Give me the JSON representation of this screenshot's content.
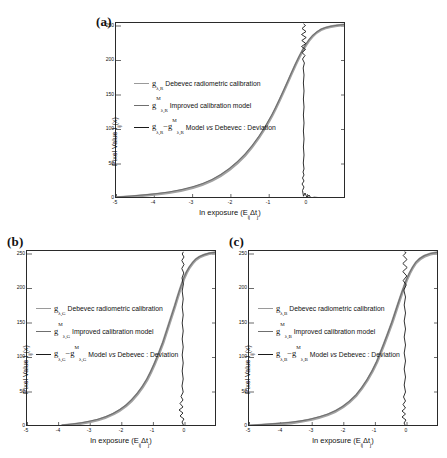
{
  "figure": {
    "panels": [
      {
        "label": "(a)",
        "channel": "R",
        "axes": {
          "xlabel_prefix": "ln exposure (E",
          "xlabel_sub1": "ij",
          "xlabel_mid": "Δt",
          "xlabel_sub2": "j",
          "xlabel_suffix": ")",
          "ylabel_prefix": "Pixel Value I",
          "ylabel_sub": "ij",
          "ylabel_suffix": "(x)",
          "xticks": [
            "-5",
            "-4",
            "-3",
            "-2",
            "-1",
            "0"
          ],
          "yticks": [
            "0",
            "50",
            "100",
            "150",
            "200",
            "250"
          ],
          "xlim": [
            -5.3,
            0.7
          ],
          "ylim": [
            0,
            255
          ]
        },
        "legend": [
          {
            "symbol": "g",
            "sub": "λ,R",
            "sup": "",
            "sub2": "",
            "sup2": "",
            "minus": false,
            "text": "Debevec radiometric calibration",
            "italic_word": "",
            "color": "#9a9a9a"
          },
          {
            "symbol": "g",
            "sub": "λ,R",
            "sup": "M",
            "sub2": "",
            "sup2": "",
            "minus": false,
            "text": "Improved calibration model",
            "italic_word": "",
            "color": "#6f6f6f"
          },
          {
            "symbol": "g",
            "sub": "λ,R",
            "sup": "",
            "sub2": "λ,R",
            "sup2": "M",
            "minus": true,
            "text": "Model vs Debevec : Deviation",
            "italic_word": "vs",
            "color": "#1a1a1a"
          }
        ]
      },
      {
        "label": "(b)",
        "channel": "G",
        "axes": {
          "xlabel_prefix": "ln exposure (E",
          "xlabel_sub1": "ij",
          "xlabel_mid": "Δt",
          "xlabel_sub2": "j",
          "xlabel_suffix": ")",
          "ylabel_prefix": "Pixel Value I",
          "ylabel_sub": "ij",
          "ylabel_suffix": "(x)",
          "xticks": [
            "-5",
            "-4",
            "-3",
            "-2",
            "-1",
            "0"
          ],
          "yticks": [
            "0",
            "50",
            "100",
            "150",
            "200",
            "250"
          ],
          "xlim": [
            -5.3,
            0.7
          ],
          "ylim": [
            0,
            255
          ]
        },
        "legend": [
          {
            "symbol": "g",
            "sub": "λ,G",
            "sup": "",
            "sub2": "",
            "sup2": "",
            "minus": false,
            "text": "Debevec radiometric calibration",
            "italic_word": "",
            "color": "#9a9a9a"
          },
          {
            "symbol": "g",
            "sub": "λ,G",
            "sup": "M",
            "sub2": "",
            "sup2": "",
            "minus": false,
            "text": "Improved calibration model",
            "italic_word": "",
            "color": "#6f6f6f"
          },
          {
            "symbol": "g",
            "sub": "λ,G",
            "sup": "",
            "sub2": "λ,G",
            "sup2": "M",
            "minus": true,
            "text": "Model vs Debevec : Deviation",
            "italic_word": "vs",
            "color": "#1a1a1a"
          }
        ]
      },
      {
        "label": "(c)",
        "channel": "B",
        "axes": {
          "xlabel_prefix": "ln exposure (E",
          "xlabel_sub1": "ij",
          "xlabel_mid": "Δt",
          "xlabel_sub2": "j",
          "xlabel_suffix": ")",
          "ylabel_prefix": "Pixel Value I",
          "ylabel_sub": "ij",
          "ylabel_suffix": "(x)",
          "xticks": [
            "-5",
            "-4",
            "-3",
            "-2",
            "-1",
            "0"
          ],
          "yticks": [
            "0",
            "50",
            "100",
            "150",
            "200",
            "250"
          ],
          "xlim": [
            -5.3,
            0.7
          ],
          "ylim": [
            0,
            255
          ]
        },
        "legend": [
          {
            "symbol": "g",
            "sub": "λ,B",
            "sup": "",
            "sub2": "",
            "sup2": "",
            "minus": false,
            "text": "Debevec radiometric calibration",
            "italic_word": "",
            "color": "#9a9a9a"
          },
          {
            "symbol": "g",
            "sub": "λ,B",
            "sup": "M",
            "sub2": "",
            "sup2": "",
            "minus": false,
            "text": "Improved calibration model",
            "italic_word": "",
            "color": "#6f6f6f"
          },
          {
            "symbol": "g",
            "sub": "λ,B",
            "sup": "",
            "sub2": "λ,B",
            "sup2": "M",
            "minus": true,
            "text": "Model vs Debevec : Deviation",
            "italic_word": "vs",
            "color": "#1a1a1a"
          }
        ]
      }
    ]
  },
  "chart_data": [
    {
      "type": "line",
      "panel": "(a)",
      "title": "",
      "xlabel": "ln exposure (E_ij Δt_j)",
      "ylabel": "Pixel Value I_ij(x)",
      "xlim": [
        -5.3,
        0.7
      ],
      "ylim": [
        0,
        255
      ],
      "xticks": [
        -5,
        -4,
        -3,
        -2,
        -1,
        0
      ],
      "yticks": [
        0,
        50,
        100,
        150,
        200,
        250
      ],
      "grid": false,
      "legend_position": "center-left",
      "series": [
        {
          "name": "g_λ,R Debevec radiometric calibration",
          "color": "#9a9a9a",
          "x": [
            -5.3,
            -5.0,
            -4.5,
            -4.0,
            -3.5,
            -3.0,
            -2.6,
            -2.2,
            -1.8,
            -1.5,
            -1.2,
            -1.0,
            -0.8,
            -0.6,
            -0.45,
            -0.35,
            -0.25,
            -0.18,
            -0.12,
            -0.06,
            0.0,
            0.1,
            0.25,
            0.45,
            0.7
          ],
          "y": [
            2,
            3,
            5,
            7,
            10,
            15,
            21,
            30,
            44,
            58,
            78,
            95,
            116,
            142,
            163,
            178,
            194,
            206,
            216,
            227,
            236,
            243,
            249,
            252,
            254
          ]
        },
        {
          "name": "g_λ,R^M Improved calibration model",
          "color": "#6f6f6f",
          "x": [
            -5.3,
            -5.0,
            -4.5,
            -4.0,
            -3.5,
            -3.0,
            -2.6,
            -2.2,
            -1.8,
            -1.5,
            -1.2,
            -1.0,
            -0.8,
            -0.6,
            -0.45,
            -0.35,
            -0.25,
            -0.18,
            -0.12,
            -0.06,
            0.0,
            0.1,
            0.25,
            0.45,
            0.7
          ],
          "y": [
            2,
            3,
            5,
            8,
            11,
            16,
            22,
            31,
            45,
            60,
            80,
            97,
            118,
            144,
            165,
            180,
            196,
            207,
            217,
            228,
            237,
            244,
            250,
            253,
            255
          ]
        },
        {
          "name": "g_λ,R - g_λ,R^M Model vs Debevec : Deviation",
          "color": "#1a1a1a",
          "description": "near-vertical jagged deviation trace centered at x ≈ -0.05, amplitude grows toward top (pixel value 250) and a wide lobe near pixel value 0",
          "x": [
            -0.05,
            -0.04,
            -0.06,
            -0.05,
            -0.07,
            -0.04,
            -0.05,
            -0.06,
            -0.05,
            -0.05,
            -0.06,
            -0.05,
            -0.04,
            -0.06,
            -0.09,
            -0.05,
            -0.12,
            -0.07,
            -0.18,
            -0.1,
            -0.22,
            -0.14,
            -0.25,
            -0.16,
            -0.28
          ],
          "y": [
            0,
            6,
            12,
            20,
            28,
            40,
            55,
            70,
            88,
            105,
            125,
            145,
            162,
            178,
            192,
            203,
            212,
            220,
            228,
            234,
            240,
            244,
            248,
            251,
            254
          ]
        }
      ]
    },
    {
      "type": "line",
      "panel": "(b)",
      "title": "",
      "xlabel": "ln exposure (E_ij Δt_j)",
      "ylabel": "Pixel Value I_ij(x)",
      "xlim": [
        -5.3,
        0.7
      ],
      "ylim": [
        0,
        255
      ],
      "xticks": [
        -5,
        -4,
        -3,
        -2,
        -1,
        0
      ],
      "yticks": [
        0,
        50,
        100,
        150,
        200,
        250
      ],
      "grid": false,
      "legend_position": "center-left",
      "series": [
        {
          "name": "g_λ,G Debevec radiometric calibration",
          "color": "#9a9a9a",
          "x": [
            -4.1,
            -3.8,
            -3.4,
            -3.0,
            -2.6,
            -2.2,
            -1.9,
            -1.6,
            -1.35,
            -1.1,
            -0.9,
            -0.7,
            -0.55,
            -0.42,
            -0.32,
            -0.24,
            -0.18,
            -0.13,
            -0.08,
            -0.04,
            0.0,
            0.08,
            0.2,
            0.4,
            0.7
          ],
          "y": [
            2,
            4,
            6,
            10,
            16,
            24,
            33,
            45,
            58,
            75,
            92,
            113,
            133,
            153,
            171,
            186,
            198,
            209,
            219,
            228,
            235,
            242,
            248,
            252,
            254
          ]
        },
        {
          "name": "g_λ,G^M Improved calibration model",
          "color": "#6f6f6f",
          "x": [
            -4.1,
            -3.8,
            -3.4,
            -3.0,
            -2.6,
            -2.2,
            -1.9,
            -1.6,
            -1.35,
            -1.1,
            -0.9,
            -0.7,
            -0.55,
            -0.42,
            -0.32,
            -0.24,
            -0.18,
            -0.13,
            -0.08,
            -0.04,
            0.0,
            0.08,
            0.2,
            0.4,
            0.7
          ],
          "y": [
            2,
            4,
            7,
            11,
            17,
            25,
            34,
            46,
            60,
            77,
            94,
            115,
            135,
            155,
            173,
            188,
            200,
            210,
            220,
            229,
            236,
            243,
            249,
            253,
            255
          ]
        },
        {
          "name": "g_λ,G - g_λ,G^M Model vs Debevec : Deviation",
          "color": "#1a1a1a",
          "description": "near-vertical deviation trace at x ≈ -0.05 with small jitter; wider lobe near pixel value 0-20",
          "x": [
            -0.25,
            -0.08,
            -0.05,
            -0.12,
            -0.06,
            -0.05,
            -0.07,
            -0.05,
            -0.05,
            -0.06,
            -0.05,
            -0.05,
            -0.06,
            -0.05,
            -0.05,
            -0.06,
            -0.05,
            -0.06,
            -0.05,
            -0.07,
            -0.05,
            -0.06,
            -0.05,
            -0.06,
            -0.05
          ],
          "y": [
            0,
            5,
            10,
            16,
            24,
            34,
            48,
            62,
            80,
            98,
            118,
            138,
            156,
            172,
            186,
            198,
            208,
            217,
            225,
            232,
            238,
            243,
            247,
            251,
            254
          ]
        }
      ]
    },
    {
      "type": "line",
      "panel": "(c)",
      "title": "",
      "xlabel": "ln exposure (E_ij Δt_j)",
      "ylabel": "Pixel Value I_ij(x)",
      "xlim": [
        -5.3,
        0.7
      ],
      "ylim": [
        0,
        255
      ],
      "xticks": [
        -5,
        -4,
        -3,
        -2,
        -1,
        0
      ],
      "yticks": [
        0,
        50,
        100,
        150,
        200,
        250
      ],
      "grid": false,
      "legend_position": "center-left",
      "series": [
        {
          "name": "g_λ,B Debevec radiometric calibration",
          "color": "#9a9a9a",
          "x": [
            -5.2,
            -4.8,
            -4.4,
            -4.0,
            -3.5,
            -3.0,
            -2.6,
            -2.2,
            -1.9,
            -1.6,
            -1.3,
            -1.05,
            -0.85,
            -0.65,
            -0.5,
            -0.38,
            -0.28,
            -0.2,
            -0.14,
            -0.07,
            0.0,
            0.1,
            0.25,
            0.45,
            0.7
          ],
          "y": [
            2,
            3,
            5,
            7,
            11,
            17,
            24,
            34,
            44,
            58,
            76,
            94,
            112,
            136,
            156,
            174,
            190,
            202,
            212,
            224,
            234,
            242,
            248,
            252,
            254
          ]
        },
        {
          "name": "g_λ,B^M Improved calibration model",
          "color": "#6f6f6f",
          "x": [
            -5.2,
            -4.8,
            -4.4,
            -4.0,
            -3.5,
            -3.0,
            -2.6,
            -2.2,
            -1.9,
            -1.6,
            -1.3,
            -1.05,
            -0.85,
            -0.65,
            -0.5,
            -0.38,
            -0.28,
            -0.2,
            -0.14,
            -0.07,
            0.0,
            0.1,
            0.25,
            0.45,
            0.7
          ],
          "y": [
            2,
            3,
            6,
            8,
            12,
            18,
            25,
            35,
            46,
            60,
            78,
            96,
            114,
            138,
            158,
            176,
            192,
            204,
            214,
            225,
            235,
            243,
            249,
            253,
            255
          ]
        },
        {
          "name": "g_λ,B - g_λ,B^M Model vs Debevec : Deviation",
          "color": "#1a1a1a",
          "description": "near-vertical jagged deviation trace at x ≈ -0.05; jitter amplitude largest above pixel value 200 and a wide horizontal lobe near pixel value 0",
          "x": [
            -0.05,
            -0.06,
            -0.05,
            -0.07,
            -0.04,
            -0.06,
            -0.05,
            -0.05,
            -0.06,
            -0.05,
            -0.05,
            -0.06,
            -0.05,
            -0.05,
            -0.07,
            -0.05,
            -0.1,
            -0.06,
            -0.15,
            -0.08,
            -0.2,
            -0.12,
            -0.24,
            -0.15,
            -0.26
          ],
          "y": [
            0,
            6,
            13,
            22,
            32,
            45,
            60,
            76,
            94,
            112,
            132,
            150,
            167,
            182,
            195,
            206,
            215,
            223,
            230,
            236,
            241,
            246,
            249,
            252,
            254
          ]
        }
      ]
    }
  ]
}
